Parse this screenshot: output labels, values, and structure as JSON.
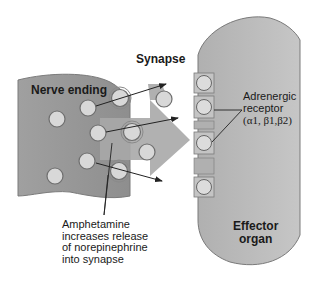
{
  "labels": {
    "synapse": "Synapse",
    "nerve_ending": "Nerve ending",
    "adrenergic_receptor": [
      "Adrenergic",
      "receptor",
      "(α1, β1,β2)"
    ],
    "effector_organ": [
      "Effector",
      "organ"
    ],
    "amphetamine_note": [
      "Amphetamine",
      "increases release",
      "of norepinephrine",
      "into synapse"
    ]
  },
  "colors": {
    "nerve_fill": "#9a9a9a",
    "effector_fill": "#b8b8b8",
    "vesicle_fill": "#d6d6d6",
    "outline": "#6a6a6a",
    "arrow": "#222222"
  }
}
